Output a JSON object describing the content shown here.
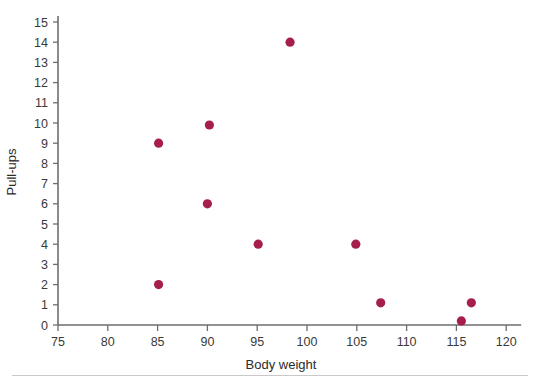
{
  "chart_data": {
    "type": "scatter",
    "title": "",
    "xlabel": "Body weight",
    "ylabel": "Pull-ups",
    "xlim": [
      75,
      121.5
    ],
    "ylim": [
      0,
      15.3
    ],
    "grid": false,
    "legend": null,
    "marker_color": "#A51E4D",
    "axis_color": "#6e6e6e",
    "xticks": [
      75,
      80,
      85,
      90,
      95,
      100,
      105,
      110,
      115,
      120
    ],
    "xticklabels": [
      "75",
      "80",
      "85",
      "90",
      "95",
      "100",
      "105",
      "110",
      "115",
      "120"
    ],
    "yticks": [
      0,
      1,
      2,
      3,
      4,
      5,
      6,
      7,
      8,
      9,
      10,
      11,
      12,
      13,
      14,
      15
    ],
    "yticklabels": [
      "0",
      "1",
      "2",
      "3",
      "4",
      "5",
      "6",
      "7",
      "8",
      "9",
      "10",
      "11",
      "12",
      "13",
      "14",
      "15"
    ],
    "points": [
      {
        "x": 85.1,
        "y": 9.0
      },
      {
        "x": 85.1,
        "y": 2.0
      },
      {
        "x": 90.2,
        "y": 9.9
      },
      {
        "x": 90.0,
        "y": 6.0
      },
      {
        "x": 95.1,
        "y": 4.0
      },
      {
        "x": 98.3,
        "y": 14.0
      },
      {
        "x": 104.9,
        "y": 4.0
      },
      {
        "x": 107.4,
        "y": 1.1
      },
      {
        "x": 115.5,
        "y": 0.2
      },
      {
        "x": 116.5,
        "y": 1.1
      }
    ]
  }
}
